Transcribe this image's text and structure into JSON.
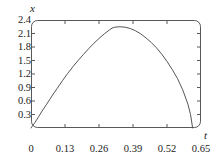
{
  "figure": {
    "background_color": "#ffffff",
    "frame_color": "#585858",
    "curve_color": "#555555",
    "text_color": "#1a1a1a"
  },
  "chart_data": {
    "type": "line",
    "title": "",
    "subtitle": "",
    "xlabel": "t",
    "ylabel": "x",
    "grid": false,
    "legend": null,
    "xlim": [
      0,
      0.65
    ],
    "ylim": [
      0,
      2.4
    ],
    "xticks": [
      0,
      0.13,
      0.26,
      0.39,
      0.52,
      0.65
    ],
    "xtick_labels": [
      "0",
      "0.13",
      "0.26",
      "0.39",
      "0.52",
      "0.65"
    ],
    "yticks": [
      0.3,
      0.6,
      0.9,
      1.2,
      1.5,
      1.8,
      2.1,
      2.4
    ],
    "ytick_labels": [
      "0.3",
      "0.6",
      "0.9",
      "1.2",
      "1.5",
      "1.8",
      "2.1",
      "2.4"
    ],
    "annotations": [],
    "series": [
      {
        "name": "x(t)",
        "color": "#555555",
        "x": [
          0.0,
          0.015,
          0.03,
          0.045,
          0.06,
          0.08,
          0.1,
          0.12,
          0.14,
          0.16,
          0.18,
          0.2,
          0.22,
          0.24,
          0.26,
          0.28,
          0.3,
          0.31,
          0.32,
          0.34,
          0.36,
          0.38,
          0.4,
          0.42,
          0.44,
          0.46,
          0.48,
          0.5,
          0.52,
          0.54,
          0.56,
          0.58,
          0.6,
          0.61,
          0.618
        ],
        "y": [
          0.0,
          0.12,
          0.26,
          0.4,
          0.53,
          0.71,
          0.88,
          1.05,
          1.21,
          1.36,
          1.5,
          1.63,
          1.76,
          1.88,
          1.99,
          2.09,
          2.18,
          2.22,
          2.24,
          2.25,
          2.24,
          2.21,
          2.16,
          2.09,
          2.0,
          1.9,
          1.78,
          1.64,
          1.48,
          1.3,
          1.1,
          0.85,
          0.53,
          0.3,
          0.0
        ]
      }
    ],
    "peak": {
      "t": 0.33,
      "x": 2.25
    },
    "zero_crossings": [
      0.0,
      0.618
    ]
  },
  "labels": {
    "y_axis": "x",
    "x_axis": "t"
  }
}
